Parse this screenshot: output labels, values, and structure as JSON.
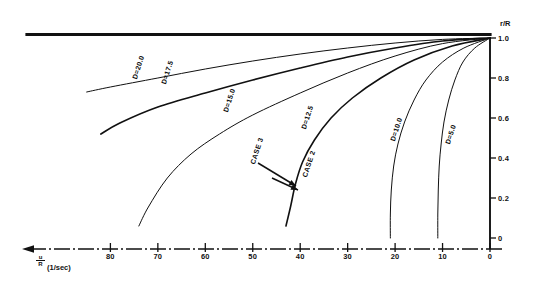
{
  "figure": {
    "kind": "scientific-plot",
    "background_color": "#ffffff",
    "line_color": "#111111"
  },
  "axes": {
    "y": {
      "title": "r/R",
      "ticks": [
        "1.0",
        "0.8",
        "0.6",
        "0.4",
        "0.2",
        "0"
      ],
      "tick_values": [
        1.0,
        0.8,
        0.6,
        0.4,
        0.2,
        0.0
      ],
      "range": [
        0.0,
        1.0
      ],
      "position": "right"
    },
    "x": {
      "title_numerator": "u",
      "title_denominator": "R",
      "title_units": "(1/sec)",
      "title_full": "u/R (1/sec)",
      "ticks": [
        "80",
        "70",
        "60",
        "50",
        "40",
        "30",
        "20",
        "10",
        "0"
      ],
      "tick_values": [
        80,
        70,
        60,
        50,
        40,
        30,
        20,
        10,
        0
      ],
      "range": [
        0,
        85
      ],
      "direction": "decreasing-left-to-right",
      "style": "dash-dot",
      "arrow": "left"
    }
  },
  "chart_data": {
    "type": "line",
    "title": "",
    "xlabel": "u/R (1/sec)",
    "ylabel": "r/R",
    "xlim": [
      85,
      0
    ],
    "ylim": [
      0,
      1.0
    ],
    "grid": false,
    "legend": "inline-curve-labels",
    "series": [
      {
        "name": "D=20.0",
        "label": "D=20.0",
        "label_rotation_deg": -72,
        "points": [
          [
            85.0,
            0.73
          ],
          [
            80.0,
            0.755
          ],
          [
            70.0,
            0.8
          ],
          [
            60.0,
            0.845
          ],
          [
            50.0,
            0.885
          ],
          [
            40.0,
            0.92
          ],
          [
            30.0,
            0.95
          ],
          [
            20.0,
            0.975
          ],
          [
            10.0,
            0.993
          ],
          [
            0.0,
            1.0
          ]
        ]
      },
      {
        "name": "D=17.5",
        "label": "D=17.5",
        "label_rotation_deg": -72,
        "points": [
          [
            82.0,
            0.52
          ],
          [
            78.0,
            0.575
          ],
          [
            70.0,
            0.655
          ],
          [
            60.0,
            0.725
          ],
          [
            50.0,
            0.79
          ],
          [
            40.0,
            0.85
          ],
          [
            30.0,
            0.905
          ],
          [
            20.0,
            0.95
          ],
          [
            10.0,
            0.985
          ],
          [
            0.0,
            1.0
          ]
        ]
      },
      {
        "name": "D=15.0",
        "label": "D=15.0",
        "label_rotation_deg": -72,
        "points": [
          [
            74.0,
            0.06
          ],
          [
            72.0,
            0.155
          ],
          [
            68.0,
            0.3
          ],
          [
            63.0,
            0.42
          ],
          [
            57.0,
            0.52
          ],
          [
            50.0,
            0.615
          ],
          [
            40.0,
            0.725
          ],
          [
            30.0,
            0.825
          ],
          [
            20.0,
            0.91
          ],
          [
            10.0,
            0.972
          ],
          [
            0.0,
            1.0
          ]
        ]
      },
      {
        "name": "D=12.5",
        "label": "D=12.5",
        "label_rotation_deg": -72,
        "points": [
          [
            43.0,
            0.06
          ],
          [
            42.0,
            0.16
          ],
          [
            41.0,
            0.27
          ],
          [
            39.5,
            0.38
          ],
          [
            37.0,
            0.49
          ],
          [
            33.5,
            0.6
          ],
          [
            29.0,
            0.7
          ],
          [
            23.0,
            0.8
          ],
          [
            16.0,
            0.89
          ],
          [
            8.0,
            0.96
          ],
          [
            0.0,
            1.0
          ]
        ]
      },
      {
        "name": "D=10.0",
        "label": "D=10.0",
        "label_rotation_deg": -72,
        "points": [
          [
            21.0,
            0.0
          ],
          [
            21.0,
            0.12
          ],
          [
            20.8,
            0.24
          ],
          [
            20.3,
            0.36
          ],
          [
            19.4,
            0.47
          ],
          [
            18.0,
            0.58
          ],
          [
            16.0,
            0.69
          ],
          [
            13.5,
            0.79
          ],
          [
            10.0,
            0.88
          ],
          [
            5.5,
            0.95
          ],
          [
            0.0,
            1.0
          ]
        ]
      },
      {
        "name": "D=5.0",
        "label": "D=5.0",
        "label_rotation_deg": -72,
        "points": [
          [
            11.0,
            0.0
          ],
          [
            11.0,
            0.12
          ],
          [
            10.9,
            0.24
          ],
          [
            10.7,
            0.36
          ],
          [
            10.3,
            0.47
          ],
          [
            9.7,
            0.58
          ],
          [
            8.7,
            0.69
          ],
          [
            7.4,
            0.79
          ],
          [
            5.7,
            0.88
          ],
          [
            3.2,
            0.95
          ],
          [
            0.0,
            1.0
          ]
        ]
      }
    ],
    "annotations": [
      {
        "text": "CASE 3",
        "rotation_deg": -72,
        "x_data": 41.5,
        "y_data": 0.46,
        "arrow_from": [
          41.5,
          0.44
        ],
        "arrow_to": [
          37.5,
          0.3
        ]
      },
      {
        "text": "CASE 2",
        "rotation_deg": -72,
        "x_data": 32.5,
        "y_data": 0.39,
        "arrow_from": [
          36.5,
          0.28
        ],
        "arrow_to": [
          32.8,
          0.23
        ]
      }
    ]
  }
}
